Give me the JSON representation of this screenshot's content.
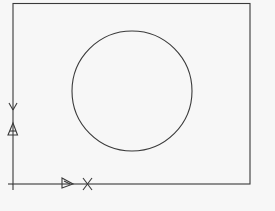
{
  "figure": {
    "type": "cad-drawing",
    "background": "#f7f7f7",
    "stroke_color": "#3a3a3a",
    "rectangle": {
      "x": 13,
      "y": 3,
      "width": 237,
      "height": 181
    },
    "circle": {
      "cx": 132,
      "cy": 91,
      "r": 60
    },
    "ucs_icon": {
      "origin": {
        "x": 13,
        "y": 184
      },
      "x_axis_label": "X",
      "y_axis_label": "Y"
    }
  }
}
